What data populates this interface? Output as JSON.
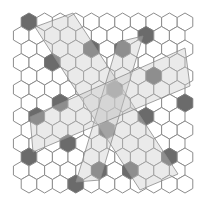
{
  "diagram": {
    "type": "hexagonal-grid",
    "grid": {
      "rows": 13,
      "cols": 11,
      "origin_x": 29,
      "origin_y": 22,
      "col_pitch": 15.6,
      "row_pitch": 13.5,
      "hex_radius": 9.0,
      "odd_row_offset": -7.8
    },
    "colors": {
      "background": "#ffffff",
      "hex_stroke": "#8c8c8c",
      "hex_fill": "#ffffff",
      "dark_fill": "#6b6b6b",
      "overlay_fill": "#c8c8c8"
    },
    "dark_cells": [
      {
        "row": 0,
        "col": 0
      },
      {
        "row": 1,
        "col": 8
      },
      {
        "row": 2,
        "col": 4
      },
      {
        "row": 2,
        "col": 6
      },
      {
        "row": 3,
        "col": 2
      },
      {
        "row": 3,
        "col": 11
      },
      {
        "row": 4,
        "col": 8
      },
      {
        "row": 5,
        "col": 6
      },
      {
        "row": 6,
        "col": 2
      },
      {
        "row": 6,
        "col": 10
      },
      {
        "row": 7,
        "col": 1
      },
      {
        "row": 7,
        "col": 8
      },
      {
        "row": 8,
        "col": 5
      },
      {
        "row": 9,
        "col": 3
      },
      {
        "row": 10,
        "col": 0
      },
      {
        "row": 10,
        "col": 9
      },
      {
        "row": 11,
        "col": 5
      },
      {
        "row": 11,
        "col": 7
      },
      {
        "row": 12,
        "col": 3
      }
    ],
    "overlays": [
      {
        "name": "overlay-diagonal-band",
        "points": [
          [
            35,
            27
          ],
          [
            73,
            13
          ],
          [
            178,
            174
          ],
          [
            140,
            190
          ]
        ]
      },
      {
        "name": "overlay-vertical-band",
        "points": [
          [
            118,
            42
          ],
          [
            143,
            36
          ],
          [
            100,
            180
          ],
          [
            76,
            182
          ]
        ]
      },
      {
        "name": "overlay-horizontal-band",
        "points": [
          [
            30,
            117
          ],
          [
            185,
            48
          ],
          [
            190,
            86
          ],
          [
            33,
            152
          ]
        ]
      }
    ]
  }
}
